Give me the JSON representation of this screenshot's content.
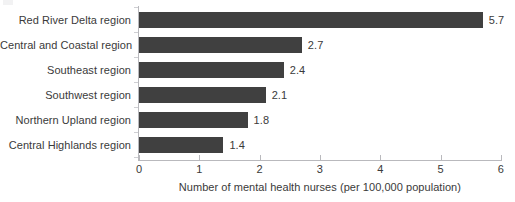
{
  "chart_data": {
    "type": "bar",
    "orientation": "horizontal",
    "title": "",
    "xlabel": "Number of mental health nurses (per 100,000 population)",
    "ylabel": "",
    "categories": [
      "Red River Delta region",
      "Central and Coastal region",
      "Southeast region",
      "Southwest region",
      "Northern Upland region",
      "Central Highlands region"
    ],
    "values": [
      5.7,
      2.7,
      2.4,
      2.1,
      1.8,
      1.4
    ],
    "value_labels": [
      "5.7",
      "2.7",
      "2.4",
      "2.1",
      "1.8",
      "1.4"
    ],
    "xlim": [
      0,
      6
    ],
    "xticks": [
      0,
      1,
      2,
      3,
      4,
      5,
      6
    ],
    "xtick_labels": [
      "0",
      "1",
      "2",
      "3",
      "4",
      "5",
      "6"
    ],
    "grid": false,
    "legend": null,
    "bar_color": "#404040",
    "axis_color": "#b9b9bd",
    "text_color": "#3a3a3a",
    "background": "#ffffff"
  }
}
